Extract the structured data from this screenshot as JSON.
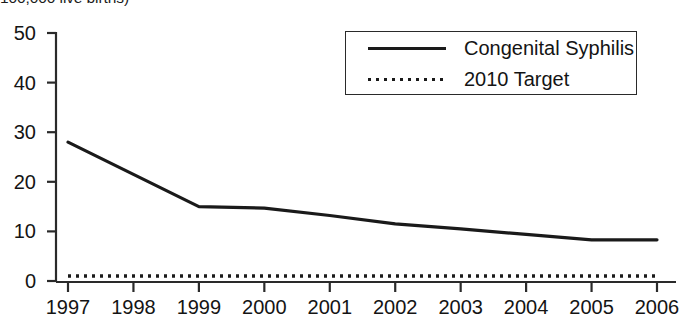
{
  "axis_caption": "100,000 live births)",
  "legend": {
    "position": "top-right",
    "entries": [
      {
        "label": "Congenital Syphilis",
        "style": "solid",
        "key_icon": "solid-line-icon"
      },
      {
        "label": "2010 Target",
        "style": "dotted",
        "key_icon": "dotted-line-icon"
      }
    ]
  },
  "colors": {
    "line": "#1a1a1a",
    "target": "#1a1a1a",
    "axis": "#2a2a2a",
    "text": "#141414",
    "background": "#ffffff"
  },
  "chart_data": {
    "type": "line",
    "title": "",
    "subtitle": "",
    "xlabel": "",
    "ylabel": "100,000 live births)",
    "categories": [
      "1997",
      "1998",
      "1999",
      "2000",
      "2001",
      "2002",
      "2003",
      "2004",
      "2005",
      "2006"
    ],
    "x": [
      1997,
      1998,
      1999,
      2000,
      2001,
      2002,
      2003,
      2004,
      2005,
      2006
    ],
    "xlim": [
      1997,
      2006
    ],
    "ylim": [
      0,
      50
    ],
    "yticks": [
      0,
      10,
      20,
      30,
      40,
      50
    ],
    "xticks": [
      "1997",
      "1998",
      "1999",
      "2000",
      "2001",
      "2002",
      "2003",
      "2004",
      "2005",
      "2006"
    ],
    "grid": false,
    "legend_position": "top-right",
    "series": [
      {
        "name": "Congenital Syphilis",
        "style": "solid",
        "values": [
          28.0,
          21.5,
          15.0,
          14.7,
          13.2,
          11.5,
          10.5,
          9.4,
          8.3,
          8.3
        ]
      },
      {
        "name": "2010 Target",
        "style": "dotted",
        "values": [
          1.0,
          1.0,
          1.0,
          1.0,
          1.0,
          1.0,
          1.0,
          1.0,
          1.0,
          1.0
        ]
      }
    ]
  }
}
